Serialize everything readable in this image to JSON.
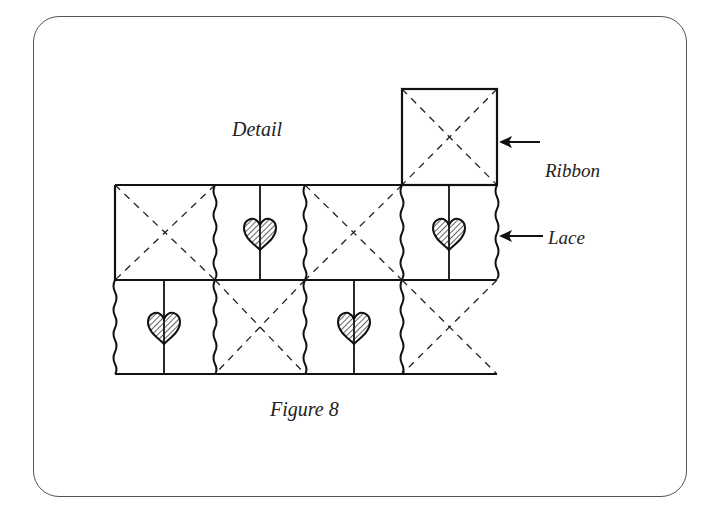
{
  "diagram": {
    "title": "Detail",
    "caption": "Figure 8",
    "labels": {
      "ribbon": "Ribbon",
      "lace": "Lace"
    },
    "grid": {
      "top_square": "ribbon-x",
      "row1": [
        "ribbon-x",
        "heart",
        "ribbon-x",
        "heart"
      ],
      "row2": [
        "heart",
        "ribbon-x",
        "heart",
        "ribbon-x"
      ]
    }
  }
}
